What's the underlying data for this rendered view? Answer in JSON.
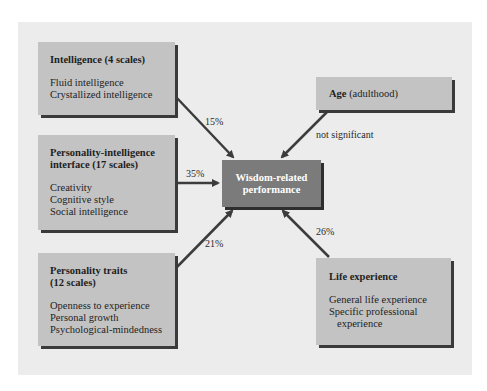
{
  "diagram": {
    "center": {
      "line1": "Wisdom-related",
      "line2": "performance"
    },
    "predictors": [
      {
        "id": "intelligence",
        "title": "Intelligence (4 scales)",
        "items": [
          "Fluid intelligence",
          "Crystallized intelligence"
        ],
        "effect": "15%"
      },
      {
        "id": "personality-intelligence-interface",
        "title_line1": "Personality-intelligence",
        "title_line2": "interface (17 scales)",
        "items": [
          "Creativity",
          "Cognitive style",
          "Social intelligence"
        ],
        "effect": "35%"
      },
      {
        "id": "personality-traits",
        "title_line1": "Personality traits",
        "title_line2": "(12 scales)",
        "items": [
          "Openness to experience",
          "Personal growth",
          "Psychological-mindedness"
        ],
        "effect": "21%"
      },
      {
        "id": "age",
        "title_bold": "Age",
        "title_normal": " (adulthood)",
        "effect": "not significant"
      },
      {
        "id": "life-experience",
        "title": "Life experience",
        "items": [
          "General life experience",
          "Specific professional",
          "experience"
        ],
        "effect": "26%"
      }
    ]
  },
  "colors": {
    "panel": "#ececec",
    "box": "#c3c3c3",
    "center_box": "#7b7b7b",
    "arrow": "#3c3c3c",
    "shadow": "#3a3a3a"
  }
}
